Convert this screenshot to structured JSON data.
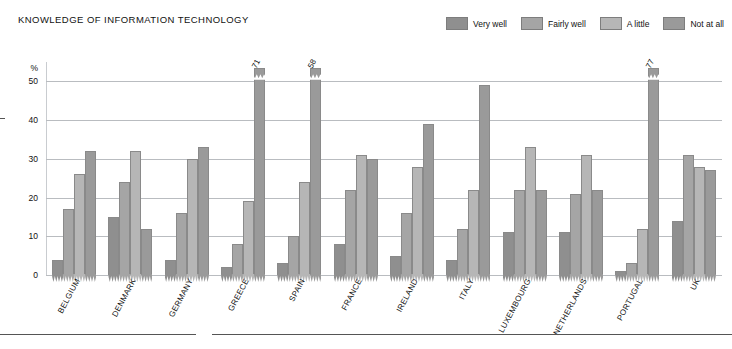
{
  "chart": {
    "title": "KNOWLEDGE OF INFORMATION TECHNOLOGY",
    "yunit": "%"
  },
  "legend": {
    "items": [
      {
        "label": "Very well",
        "color": "#8f8f8f"
      },
      {
        "label": "Fairly well",
        "color": "#a5a5a5"
      },
      {
        "label": "A little",
        "color": "#b6b6b6"
      },
      {
        "label": "Not at all",
        "color": "#9a9a9a"
      }
    ]
  },
  "chart_data": {
    "type": "bar",
    "title": "KNOWLEDGE OF INFORMATION TECHNOLOGY",
    "xlabel": "",
    "ylabel": "%",
    "ylim": [
      0,
      55
    ],
    "yticks": [
      0,
      10,
      20,
      30,
      40,
      50
    ],
    "ytick_labels": [
      "0",
      "10",
      "20",
      "30",
      "40",
      "50"
    ],
    "grid": true,
    "legend_position": "top-right",
    "note": "Bars exceeding the 50% axis maximum are clipped with an axis break and labelled with their true value.",
    "categories": [
      "BELGIUM",
      "DENMARK",
      "GERMANY",
      "GREECE",
      "SPAIN",
      "FRANCE",
      "IRELAND",
      "ITALY",
      "LUXEMBOURG",
      "NETHERLANDS",
      "PORTUGAL",
      "UK"
    ],
    "series": [
      {
        "name": "Very well",
        "color": "#8f8f8f",
        "values": [
          4,
          15,
          4,
          2,
          3,
          8,
          5,
          4,
          11,
          11,
          1,
          14
        ]
      },
      {
        "name": "Fairly well",
        "color": "#a5a5a5",
        "values": [
          17,
          24,
          16,
          8,
          10,
          22,
          16,
          12,
          22,
          21,
          3,
          31
        ]
      },
      {
        "name": "A little",
        "color": "#b6b6b6",
        "values": [
          26,
          32,
          30,
          19,
          24,
          31,
          28,
          22,
          33,
          31,
          12,
          28
        ]
      },
      {
        "name": "Not at all",
        "color": "#9a9a9a",
        "values": [
          32,
          12,
          33,
          71,
          58,
          30,
          39,
          49,
          22,
          22,
          77,
          27
        ]
      }
    ],
    "value_labels": [
      {
        "category": "GREECE",
        "series": "Not at all",
        "value": 71
      },
      {
        "category": "SPAIN",
        "series": "Not at all",
        "value": 58
      },
      {
        "category": "PORTUGAL",
        "series": "Not at all",
        "value": 77
      }
    ]
  }
}
